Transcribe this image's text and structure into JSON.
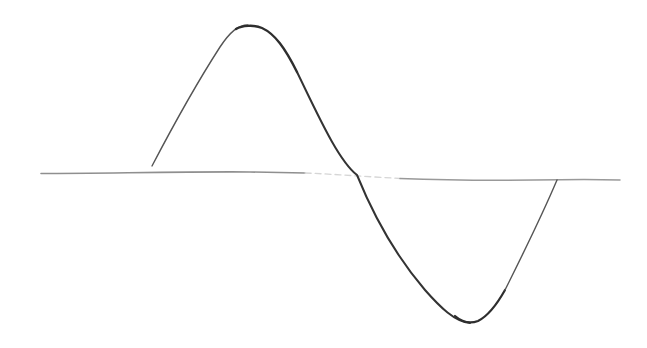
{
  "diagram": {
    "type": "hand-drawn sine wave sketch",
    "background": "#ffffff",
    "axis": {
      "color": "#8a8a8a",
      "faint_color": "#d2d2d2",
      "left": [
        41,
        173
      ],
      "right": [
        620,
        180
      ],
      "faint_range_x": [
        305,
        400
      ]
    },
    "wave": {
      "color": "#2e2e2e",
      "light_color": "#555555",
      "start": [
        152,
        166
      ],
      "peak": [
        248,
        25
      ],
      "zero_crossing": [
        357,
        175
      ],
      "trough": [
        472,
        323
      ],
      "end": [
        557,
        180
      ]
    }
  }
}
